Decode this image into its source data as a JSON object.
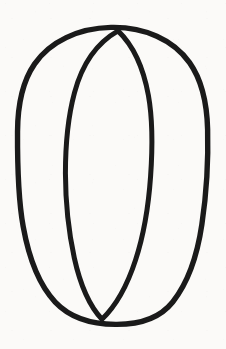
{
  "canvas": {
    "width": 226,
    "height": 349,
    "background_color": "#fbfaf8",
    "ink_color": "#1a1a1a",
    "title": "Two overlapping ellipses line drawing"
  },
  "drawing": {
    "description": "Hand-drawn black outline figure resembling the digit zero: a large tall outer ellipse with a second narrower tilted ellipse drawn inside it, the two curves crossing near the top and near the bottom.",
    "style": "hand-drawn ink outline",
    "stroke_color": "#1a1a1a",
    "stroke_width": 5,
    "shapes": [
      {
        "name": "outer-ellipse",
        "type": "ellipse",
        "center_x": 113,
        "center_y": 175,
        "radius_x": 95,
        "radius_y": 149,
        "rotation_deg": -1,
        "stroke_width": 5.4,
        "bounds": {
          "left": 18,
          "top": 27,
          "right": 208,
          "bottom": 324
        }
      },
      {
        "name": "inner-ellipse",
        "type": "ellipse",
        "center_x": 108,
        "center_y": 175,
        "radius_x": 43,
        "radius_y": 145,
        "rotation_deg": 2,
        "stroke_width": 5.0,
        "bounds": {
          "left": 65,
          "top": 30,
          "right": 151,
          "bottom": 320
        }
      }
    ],
    "intersections": [
      {
        "name": "top-crossing",
        "x": 113,
        "y": 31
      },
      {
        "name": "bottom-crossing",
        "x": 107,
        "y": 319
      }
    ]
  }
}
